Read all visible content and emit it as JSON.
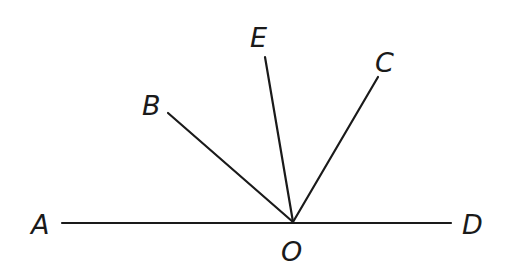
{
  "diagram": {
    "type": "geometry-rays",
    "points": {
      "A": {
        "label": "A",
        "x": 62,
        "y": 223
      },
      "D": {
        "label": "D",
        "x": 451,
        "y": 223
      },
      "O": {
        "label": "O",
        "x": 293,
        "y": 222
      },
      "B": {
        "label": "B",
        "x": 168,
        "y": 113
      },
      "E": {
        "label": "E",
        "x": 265,
        "y": 57
      },
      "C": {
        "label": "C",
        "x": 378,
        "y": 77
      }
    },
    "segments": [
      {
        "name": "AD",
        "from": "A",
        "to": "D"
      },
      {
        "name": "OB",
        "from": "O",
        "to": "B"
      },
      {
        "name": "OE",
        "from": "O",
        "to": "E"
      },
      {
        "name": "OC",
        "from": "O",
        "to": "C"
      }
    ],
    "labels": {
      "A": "A",
      "B": "B",
      "C": "C",
      "D": "D",
      "E": "E",
      "O": "O"
    },
    "colors": {
      "line": "#1a1a1a",
      "background": "#ffffff"
    }
  }
}
